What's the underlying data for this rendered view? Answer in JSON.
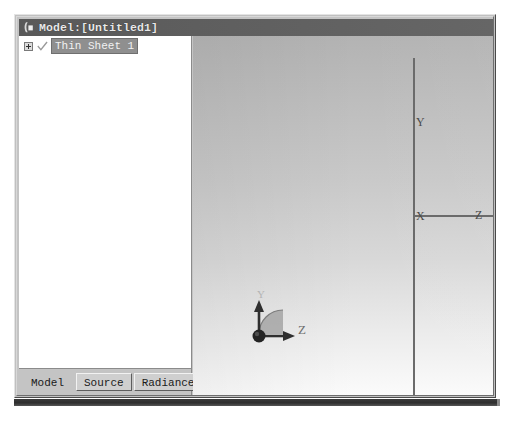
{
  "window": {
    "title": "Model:[Untitled1]",
    "icon": "application-icon",
    "title_bar_color": "#5e5e5e",
    "frame_color": "#c4c4c4"
  },
  "tree": {
    "items": [
      {
        "label": "Thin Sheet 1",
        "expander": "plus-icon",
        "check_icon": "checkmark-icon",
        "expanded": false,
        "selected": true
      }
    ]
  },
  "tabs": [
    {
      "label": "Model",
      "active": true
    },
    {
      "label": "Source",
      "active": false
    },
    {
      "label": "Radiance",
      "active": false
    }
  ],
  "viewport": {
    "background_top_color": "#b3b3b3",
    "background_bottom_color": "#fbfbfb",
    "axis_color": "#6b6b6b",
    "axes": [
      {
        "name": "Y",
        "label": "Y",
        "orientation": "vertical"
      },
      {
        "name": "X",
        "label": "X",
        "orientation": "origin"
      },
      {
        "name": "Z",
        "label": "Z",
        "orientation": "horizontal"
      }
    ],
    "gizmo": {
      "name": "orientation-gizmo",
      "up_axis_label": "Y",
      "right_axis_label": "Z",
      "arc_color": "#909090",
      "ball_color": "#2b2b2b"
    }
  }
}
